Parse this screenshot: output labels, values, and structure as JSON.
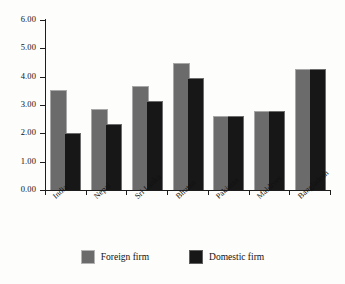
{
  "chart_data": {
    "type": "bar",
    "title": "",
    "subtitle": "",
    "xlabel": "",
    "ylabel": "",
    "categories": [
      "India",
      "Nepal",
      "Sri Lanka",
      "Bhutan",
      "Pakistan",
      "Maldives",
      "Bangladesh"
    ],
    "series": [
      {
        "name": "Foreign firm",
        "color": "#6b6b6b",
        "values": [
          3.5,
          2.82,
          3.62,
          4.45,
          2.59,
          2.75,
          4.22
        ]
      },
      {
        "name": "Domestic firm",
        "color": "#171717",
        "values": [
          1.97,
          2.28,
          3.1,
          3.93,
          2.59,
          2.75,
          4.22
        ]
      }
    ],
    "ylim": [
      0,
      6
    ],
    "ytick_values": [
      0,
      1,
      2,
      3,
      4,
      5,
      6
    ],
    "ytick_labels": [
      "0.00",
      "1.00",
      "2.00",
      "3.00",
      "4.00",
      "5.00",
      "6.00"
    ],
    "grid": false,
    "legend_position": "bottom-center",
    "legend_entries": [
      "Foreign firm",
      "Domestic firm"
    ],
    "annotations": []
  },
  "legend": {
    "items": [
      {
        "label": "Foreign firm",
        "swatch": "foreign-firm-swatch"
      },
      {
        "label": "Domestic firm",
        "swatch": "domestic-firm-swatch"
      }
    ]
  }
}
